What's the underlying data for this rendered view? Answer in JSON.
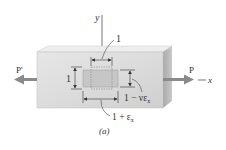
{
  "figure": {
    "caption": "(a)",
    "type": "axial-loading strain diagram"
  },
  "labels": {
    "y_axis": "y",
    "x_axis": "x",
    "load_left": "P'",
    "load_right": "P",
    "width_unstrained": "1",
    "height_unstrained": "1",
    "lateral_strained": "1 − νε",
    "lateral_sub": "x",
    "axial_strained": "1 + ε",
    "axial_sub": "x"
  },
  "colors": {
    "block_front": "#d9d9d9",
    "block_top": "#ececec",
    "block_side": "#b8b8b8",
    "element_fill": "#c4c4c4",
    "arrow": "#8a8a8a",
    "text": "#333333"
  }
}
